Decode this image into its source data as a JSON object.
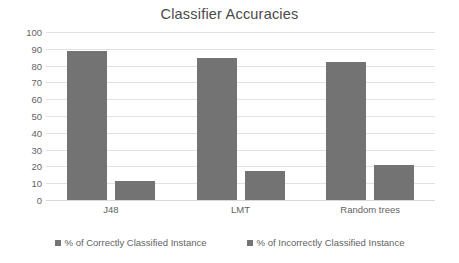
{
  "chart_data": {
    "type": "bar",
    "title": "Classifier Accuracies",
    "xlabel": "",
    "ylabel": "",
    "categories": [
      "J48",
      "LMT",
      "Random trees"
    ],
    "series": [
      {
        "name": "% of Correctly Classified Instance",
        "color": "#737373",
        "values": [
          88.5,
          84.5,
          82
        ]
      },
      {
        "name": "% of Incorrectly Classified Instance",
        "color": "#737373",
        "values": [
          11.5,
          17,
          21
        ]
      }
    ],
    "ylim": [
      0,
      100
    ],
    "ytick_step": 10,
    "yticks": [
      100,
      90,
      80,
      70,
      60,
      50,
      40,
      30,
      20,
      10,
      0
    ],
    "grid": true,
    "grid_color": "#e2e2e2",
    "legend_position": "bottom",
    "background": "#ffffff",
    "title_color": "#4a4a4a",
    "tick_label_color": "#636363"
  }
}
